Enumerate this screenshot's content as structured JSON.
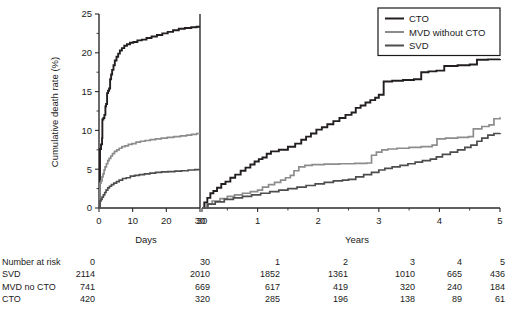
{
  "chart_data": {
    "type": "line",
    "title": "",
    "subtitle": "",
    "ylabel": "Cumulative death rate (%)",
    "ylim": [
      0,
      25
    ],
    "yticks": [
      0,
      5,
      10,
      15,
      20,
      25
    ],
    "yticklabels": [
      "0",
      "5",
      "10",
      "15",
      "20",
      "25"
    ],
    "grid": false,
    "legend_position": "top-right",
    "panels": [
      {
        "name": "days-panel",
        "xlabel": "Days",
        "xlim": [
          0,
          30
        ],
        "xticks": [
          0,
          10,
          20,
          30
        ],
        "xticklabels": [
          "0",
          "10",
          "20",
          "30"
        ]
      },
      {
        "name": "years-panel",
        "xlabel": "Years",
        "xlim": [
          0.0822,
          5
        ],
        "xticks": [
          0.0822,
          1,
          2,
          3,
          4,
          5
        ],
        "xticklabels": [
          "30",
          "1",
          "2",
          "3",
          "4",
          "5"
        ]
      }
    ],
    "series": [
      {
        "name": "CTO",
        "color": "#231f20",
        "days": [
          [
            0,
            0
          ],
          [
            0.3,
            7.6
          ],
          [
            0.6,
            8.2
          ],
          [
            0.9,
            9.0
          ],
          [
            1.0,
            11.4
          ],
          [
            1.3,
            11.6
          ],
          [
            1.6,
            12.0
          ],
          [
            1.9,
            13.1
          ],
          [
            2.1,
            13.4
          ],
          [
            2.4,
            14.8
          ],
          [
            2.7,
            15.1
          ],
          [
            3.0,
            15.4
          ],
          [
            3.3,
            16.6
          ],
          [
            3.6,
            17.2
          ],
          [
            3.9,
            17.8
          ],
          [
            4.3,
            18.4
          ],
          [
            4.7,
            19.0
          ],
          [
            5.2,
            19.5
          ],
          [
            5.7,
            19.9
          ],
          [
            6.2,
            20.3
          ],
          [
            6.8,
            20.6
          ],
          [
            7.5,
            20.9
          ],
          [
            8.3,
            21.1
          ],
          [
            9.2,
            21.3
          ],
          [
            10.2,
            21.4
          ],
          [
            11.4,
            21.6
          ],
          [
            12.7,
            21.7
          ],
          [
            14.1,
            21.9
          ],
          [
            15.6,
            22.1
          ],
          [
            17.2,
            22.3
          ],
          [
            18.8,
            22.5
          ],
          [
            20.4,
            22.7
          ],
          [
            22.0,
            22.9
          ],
          [
            23.7,
            23.1
          ],
          [
            25.5,
            23.2
          ],
          [
            27.4,
            23.3
          ],
          [
            29.0,
            23.35
          ],
          [
            30,
            23.35
          ]
        ],
        "years": [
          [
            0.0822,
            0
          ],
          [
            0.12,
            0.7
          ],
          [
            0.17,
            1.3
          ],
          [
            0.22,
            1.9
          ],
          [
            0.27,
            2.2
          ],
          [
            0.33,
            2.6
          ],
          [
            0.4,
            3.1
          ],
          [
            0.47,
            3.4
          ],
          [
            0.55,
            3.9
          ],
          [
            0.63,
            4.3
          ],
          [
            0.72,
            4.8
          ],
          [
            0.8,
            5.2
          ],
          [
            0.88,
            5.6
          ],
          [
            0.95,
            6.0
          ],
          [
            1.02,
            6.3
          ],
          [
            1.08,
            6.5
          ],
          [
            1.15,
            7.0
          ],
          [
            1.22,
            7.3
          ],
          [
            1.35,
            7.5
          ],
          [
            1.5,
            7.9
          ],
          [
            1.62,
            8.3
          ],
          [
            1.72,
            8.8
          ],
          [
            1.8,
            9.2
          ],
          [
            1.88,
            9.6
          ],
          [
            1.97,
            10.1
          ],
          [
            2.06,
            10.4
          ],
          [
            2.15,
            10.8
          ],
          [
            2.25,
            11.2
          ],
          [
            2.35,
            11.6
          ],
          [
            2.45,
            12.0
          ],
          [
            2.55,
            12.3
          ],
          [
            2.62,
            12.9
          ],
          [
            2.7,
            13.2
          ],
          [
            2.78,
            13.6
          ],
          [
            2.86,
            13.9
          ],
          [
            2.94,
            14.2
          ],
          [
            3.0,
            14.6
          ],
          [
            3.08,
            16.3
          ],
          [
            3.22,
            16.4
          ],
          [
            3.4,
            16.5
          ],
          [
            3.58,
            16.6
          ],
          [
            3.7,
            17.5
          ],
          [
            3.82,
            17.6
          ],
          [
            3.95,
            17.7
          ],
          [
            4.08,
            18.3
          ],
          [
            4.3,
            18.4
          ],
          [
            4.5,
            18.5
          ],
          [
            4.62,
            19.1
          ],
          [
            4.8,
            19.15
          ],
          [
            5.0,
            19.2
          ]
        ]
      },
      {
        "name": "MVD without CTO",
        "color": "#8c8c8c",
        "days": [
          [
            0,
            0
          ],
          [
            0.3,
            3.2
          ],
          [
            0.6,
            3.5
          ],
          [
            0.9,
            4.0
          ],
          [
            1.2,
            4.4
          ],
          [
            1.5,
            4.9
          ],
          [
            1.8,
            5.3
          ],
          [
            2.2,
            5.7
          ],
          [
            2.6,
            6.1
          ],
          [
            3.0,
            6.4
          ],
          [
            3.5,
            6.7
          ],
          [
            4.0,
            7.0
          ],
          [
            4.6,
            7.3
          ],
          [
            5.3,
            7.5
          ],
          [
            6.0,
            7.7
          ],
          [
            6.8,
            7.9
          ],
          [
            7.7,
            8.0
          ],
          [
            8.7,
            8.2
          ],
          [
            9.8,
            8.3
          ],
          [
            11.0,
            8.5
          ],
          [
            12.3,
            8.6
          ],
          [
            13.7,
            8.7
          ],
          [
            15.2,
            8.8
          ],
          [
            16.8,
            8.9
          ],
          [
            18.5,
            9.0
          ],
          [
            20.3,
            9.1
          ],
          [
            22.2,
            9.2
          ],
          [
            24.2,
            9.3
          ],
          [
            26.0,
            9.4
          ],
          [
            27.5,
            9.5
          ],
          [
            29.0,
            9.6
          ],
          [
            30,
            9.6
          ]
        ],
        "years": [
          [
            0.0822,
            0
          ],
          [
            0.15,
            0.5
          ],
          [
            0.25,
            0.9
          ],
          [
            0.38,
            1.2
          ],
          [
            0.5,
            1.5
          ],
          [
            0.62,
            1.7
          ],
          [
            0.75,
            1.9
          ],
          [
            0.88,
            2.1
          ],
          [
            1.0,
            2.3
          ],
          [
            1.08,
            2.7
          ],
          [
            1.18,
            3.0
          ],
          [
            1.28,
            3.3
          ],
          [
            1.38,
            3.6
          ],
          [
            1.46,
            3.9
          ],
          [
            1.54,
            4.2
          ],
          [
            1.6,
            4.8
          ],
          [
            1.68,
            5.3
          ],
          [
            1.78,
            5.5
          ],
          [
            1.9,
            5.6
          ],
          [
            2.1,
            5.65
          ],
          [
            2.35,
            5.7
          ],
          [
            2.6,
            5.75
          ],
          [
            2.8,
            5.8
          ],
          [
            2.88,
            6.8
          ],
          [
            2.96,
            7.2
          ],
          [
            3.05,
            7.5
          ],
          [
            3.15,
            7.6
          ],
          [
            3.3,
            7.7
          ],
          [
            3.5,
            7.8
          ],
          [
            3.7,
            7.9
          ],
          [
            3.88,
            8.1
          ],
          [
            3.96,
            8.9
          ],
          [
            4.1,
            9.0
          ],
          [
            4.3,
            9.1
          ],
          [
            4.48,
            9.2
          ],
          [
            4.56,
            10.2
          ],
          [
            4.7,
            10.5
          ],
          [
            4.82,
            10.7
          ],
          [
            4.9,
            11.5
          ],
          [
            5.0,
            11.7
          ]
        ]
      },
      {
        "name": "SVD",
        "color": "#4d4d4d",
        "days": [
          [
            0,
            0
          ],
          [
            0.3,
            0.9
          ],
          [
            0.6,
            1.1
          ],
          [
            0.9,
            1.4
          ],
          [
            1.3,
            1.7
          ],
          [
            1.7,
            2.0
          ],
          [
            2.1,
            2.3
          ],
          [
            2.6,
            2.6
          ],
          [
            3.1,
            2.8
          ],
          [
            3.7,
            3.0
          ],
          [
            4.4,
            3.2
          ],
          [
            5.2,
            3.4
          ],
          [
            6.0,
            3.6
          ],
          [
            7.0,
            3.8
          ],
          [
            8.1,
            3.9
          ],
          [
            9.3,
            4.1
          ],
          [
            10.6,
            4.2
          ],
          [
            12.0,
            4.3
          ],
          [
            13.5,
            4.4
          ],
          [
            15.1,
            4.5
          ],
          [
            16.8,
            4.6
          ],
          [
            18.6,
            4.65
          ],
          [
            20.5,
            4.7
          ],
          [
            22.5,
            4.75
          ],
          [
            24.5,
            4.8
          ],
          [
            26.5,
            4.9
          ],
          [
            28.5,
            4.95
          ],
          [
            30,
            4.95
          ]
        ],
        "years": [
          [
            0.0822,
            0
          ],
          [
            0.18,
            0.5
          ],
          [
            0.3,
            0.8
          ],
          [
            0.45,
            1.1
          ],
          [
            0.6,
            1.3
          ],
          [
            0.75,
            1.5
          ],
          [
            0.9,
            1.7
          ],
          [
            1.05,
            1.9
          ],
          [
            1.2,
            2.1
          ],
          [
            1.35,
            2.3
          ],
          [
            1.5,
            2.5
          ],
          [
            1.65,
            2.7
          ],
          [
            1.8,
            2.9
          ],
          [
            1.95,
            3.1
          ],
          [
            2.1,
            3.3
          ],
          [
            2.25,
            3.5
          ],
          [
            2.4,
            3.6
          ],
          [
            2.5,
            3.7
          ],
          [
            2.62,
            4.0
          ],
          [
            2.75,
            4.3
          ],
          [
            2.88,
            4.6
          ],
          [
            3.0,
            4.9
          ],
          [
            3.1,
            5.1
          ],
          [
            3.22,
            5.3
          ],
          [
            3.35,
            5.5
          ],
          [
            3.48,
            5.7
          ],
          [
            3.6,
            5.9
          ],
          [
            3.72,
            6.1
          ],
          [
            3.85,
            6.3
          ],
          [
            3.95,
            6.6
          ],
          [
            4.05,
            6.9
          ],
          [
            4.18,
            7.2
          ],
          [
            4.3,
            7.5
          ],
          [
            4.42,
            7.8
          ],
          [
            4.52,
            8.1
          ],
          [
            4.62,
            8.6
          ],
          [
            4.7,
            9.0
          ],
          [
            4.8,
            9.4
          ],
          [
            4.9,
            9.6
          ],
          [
            5.0,
            9.65
          ]
        ]
      }
    ]
  },
  "legend": {
    "items": [
      {
        "label": "CTO",
        "color": "#231f20"
      },
      {
        "label": "MVD without CTO",
        "color": "#8c8c8c"
      },
      {
        "label": "SVD",
        "color": "#4d4d4d"
      }
    ]
  },
  "risk_table": {
    "header_label": "Number at risk",
    "columns": [
      "0",
      "30",
      "1",
      "2",
      "3",
      "4",
      "5"
    ],
    "rows": [
      {
        "label": "SVD",
        "values": [
          "2114",
          "2010",
          "1852",
          "1361",
          "1010",
          "665",
          "436"
        ]
      },
      {
        "label": "MVD no CTO",
        "values": [
          "741",
          "669",
          "617",
          "419",
          "320",
          "240",
          "184"
        ]
      },
      {
        "label": "CTO",
        "values": [
          "420",
          "320",
          "285",
          "196",
          "138",
          "89",
          "61"
        ]
      }
    ]
  }
}
